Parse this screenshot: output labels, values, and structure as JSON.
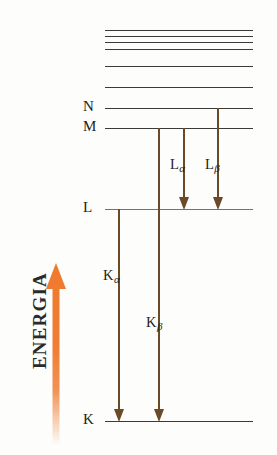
{
  "figure": {
    "type": "energy-level-diagram",
    "axis": {
      "label": "ENERGIA",
      "direction": "up",
      "color": "#f0813c"
    },
    "levels": [
      {
        "id": "upper6",
        "label": "",
        "y": 30,
        "x1": 105,
        "x2": 253,
        "color": "#3a3a3a"
      },
      {
        "id": "upper5",
        "label": "",
        "y": 36,
        "x1": 105,
        "x2": 253,
        "color": "#3a3a3a"
      },
      {
        "id": "upper4",
        "label": "",
        "y": 42,
        "x1": 105,
        "x2": 253,
        "color": "#3a3a3a"
      },
      {
        "id": "upper3",
        "label": "",
        "y": 49,
        "x1": 105,
        "x2": 253,
        "color": "#3a3a3a"
      },
      {
        "id": "upper2",
        "label": "",
        "y": 66,
        "x1": 105,
        "x2": 253,
        "color": "#3a3a3a"
      },
      {
        "id": "upper1",
        "label": "",
        "y": 87,
        "x1": 105,
        "x2": 253,
        "color": "#3a3a3a"
      },
      {
        "id": "N",
        "label": "N",
        "y": 108,
        "x1": 105,
        "x2": 253,
        "color": "#3a3a3a"
      },
      {
        "id": "M",
        "label": "M",
        "y": 128,
        "x1": 105,
        "x2": 253,
        "color": "#3a3a3a"
      },
      {
        "id": "L",
        "label": "L",
        "y": 209,
        "x1": 105,
        "x2": 253,
        "color": "#7b7257"
      },
      {
        "id": "K",
        "label": "K",
        "y": 421,
        "x1": 105,
        "x2": 253,
        "color": "#3a3a3a"
      }
    ],
    "transitions": [
      {
        "id": "K-alpha",
        "name": "K",
        "subscript": "α",
        "from": "L",
        "to": "K",
        "x": 118,
        "y_start": 209,
        "y_end": 421,
        "color": "#6b4a28",
        "label_x": 103,
        "label_y": 268
      },
      {
        "id": "K-beta",
        "name": "K",
        "subscript": "β",
        "from": "M",
        "to": "K",
        "x": 158,
        "y_start": 128,
        "y_end": 421,
        "color": "#6b4a28",
        "label_x": 146,
        "label_y": 315
      },
      {
        "id": "L-alpha",
        "name": "L",
        "subscript": "α",
        "from": "M",
        "to": "L",
        "x": 183,
        "y_start": 128,
        "y_end": 209,
        "color": "#6b4a28",
        "label_x": 170,
        "label_y": 157
      },
      {
        "id": "L-beta",
        "name": "L",
        "subscript": "β",
        "from": "N",
        "to": "L",
        "x": 217,
        "y_start": 108,
        "y_end": 209,
        "color": "#6b4a28",
        "label_x": 205,
        "label_y": 157
      }
    ]
  }
}
